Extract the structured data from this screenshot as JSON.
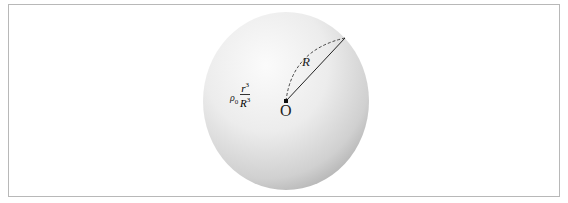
{
  "diagram": {
    "density_label": {
      "symbol": "ρ",
      "subscript": "0",
      "numerator": "r",
      "numerator_power": "3",
      "denominator": "R",
      "denominator_power": "3"
    },
    "radius_label": "R",
    "center_label": "O",
    "colors": {
      "frame": "#b8b8b8",
      "sphere_light": "#fafafa",
      "sphere_dark": "#b9b9b9",
      "line": "#222222"
    }
  }
}
